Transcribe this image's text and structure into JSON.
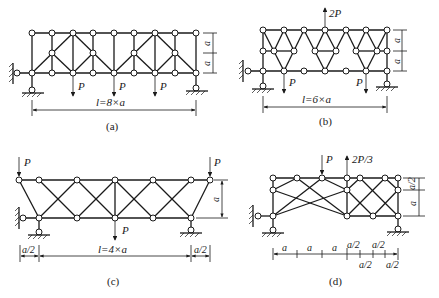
{
  "figures": [
    {
      "id": "a",
      "caption": "(a)",
      "span_label": "l=8×a",
      "height_labels": [
        "a",
        "a"
      ],
      "loads": [
        {
          "label": "P",
          "direction": "down"
        },
        {
          "label": "P",
          "direction": "down"
        },
        {
          "label": "P",
          "direction": "down"
        }
      ]
    },
    {
      "id": "b",
      "caption": "(b)",
      "span_label": "l=6×a",
      "height_labels": [
        "a",
        "a"
      ],
      "loads": [
        {
          "label": "2P",
          "direction": "up"
        },
        {
          "label": "P",
          "direction": "down"
        },
        {
          "label": "P",
          "direction": "down"
        }
      ]
    },
    {
      "id": "c",
      "caption": "(c)",
      "span_label": "l=4×a",
      "height_labels": [
        "a"
      ],
      "overhang_labels": [
        "a/2",
        "a/2"
      ],
      "loads": [
        {
          "label": "P",
          "direction": "down"
        },
        {
          "label": "P",
          "direction": "down"
        },
        {
          "label": "P",
          "direction": "down"
        }
      ]
    },
    {
      "id": "d",
      "caption": "(d)",
      "height_labels": [
        "a/2",
        "a"
      ],
      "dimension_labels_top": [
        "a",
        "a",
        "a",
        "a/2",
        "a/2"
      ],
      "dimension_labels_bottom": [
        "a/2",
        "a/2"
      ],
      "loads": [
        {
          "label": "P",
          "direction": "down"
        },
        {
          "label": "2P/3",
          "direction": "up"
        }
      ]
    }
  ]
}
